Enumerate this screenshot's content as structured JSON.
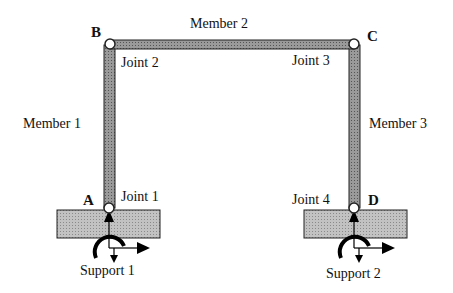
{
  "diagram": {
    "type": "portal-frame",
    "colors": {
      "member_fill": "#8a8a8a",
      "member_stroke": "#222222",
      "support_fill": "#b5b5b5",
      "joint_fill": "#ffffff",
      "arrow": "#000000"
    },
    "nodes": [
      {
        "id": "A",
        "label": "A",
        "joint_label": "Joint 1"
      },
      {
        "id": "B",
        "label": "B",
        "joint_label": "Joint 2"
      },
      {
        "id": "C",
        "label": "C",
        "joint_label": "Joint 3"
      },
      {
        "id": "D",
        "label": "D",
        "joint_label": "Joint 4"
      }
    ],
    "members": [
      {
        "label": "Member 1",
        "from": "A",
        "to": "B"
      },
      {
        "label": "Member 2",
        "from": "B",
        "to": "C"
      },
      {
        "label": "Member 3",
        "from": "C",
        "to": "D"
      }
    ],
    "supports": [
      {
        "label": "Support 1",
        "at": "A"
      },
      {
        "label": "Support 2",
        "at": "D"
      }
    ]
  }
}
